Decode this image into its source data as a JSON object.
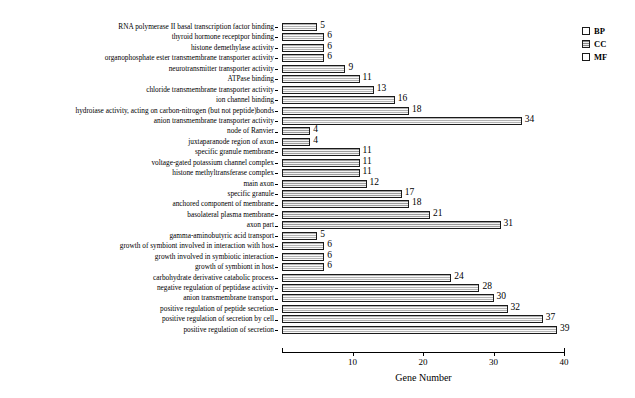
{
  "chart_data": {
    "type": "bar",
    "orientation": "horizontal",
    "title": "",
    "xlabel": "Gene Number",
    "ylabel": "",
    "xlim": [
      0,
      40
    ],
    "xticks": [
      10,
      20,
      30,
      40
    ],
    "grid": false,
    "legend_position": "top-right",
    "legend": [
      {
        "key": "BP",
        "label": "BP"
      },
      {
        "key": "CC",
        "label": "CC"
      },
      {
        "key": "MF",
        "label": "MF"
      }
    ],
    "categories": [
      "RNA polymerase II basal transcription factor binding",
      "thyroid hormone receptpor binding",
      "histone demethylase activity",
      "organophosphate ester transmembrane transporter activity",
      "neurotransmitter transporter activity",
      "ATPase binding",
      "chloride transmembrane transporter activity",
      "ion channel binding",
      "hydroiase activity, acting on carbon-nitrogen (but not peptide)bonds",
      "anion transmembrane transporter activity",
      "node of Ranvier",
      "juxtaparanode region of axon",
      "specific granule membrane",
      "voltage-gated potassium channel complex",
      "histone methyltransferase complex",
      "main axon",
      "specific granule",
      "anchored component of membrane",
      "basolateral plasma membrane",
      "axon part",
      "gamma-aminobutyric acid transport",
      "growth of symbiont involved in interaction with host",
      "growth involved in symbiotic interaction",
      "growth of symbiont in host",
      "carbohydrate derivative catabolic process",
      "negative regulation of peptidase activity",
      "anion transmembrane transport",
      "positive regulation of peptide secretion",
      "positive regulation of secretion by cell",
      "positive regulation of secretion"
    ],
    "values": [
      5,
      6,
      6,
      6,
      9,
      11,
      13,
      16,
      18,
      34,
      4,
      4,
      11,
      11,
      11,
      12,
      17,
      18,
      21,
      31,
      5,
      6,
      6,
      6,
      24,
      28,
      30,
      32,
      37,
      39
    ],
    "groups": [
      "MF",
      "MF",
      "MF",
      "MF",
      "MF",
      "MF",
      "MF",
      "MF",
      "MF",
      "MF",
      "CC",
      "CC",
      "CC",
      "CC",
      "CC",
      "CC",
      "CC",
      "CC",
      "CC",
      "CC",
      "BP",
      "BP",
      "BP",
      "BP",
      "BP",
      "BP",
      "BP",
      "BP",
      "BP",
      "BP"
    ]
  }
}
